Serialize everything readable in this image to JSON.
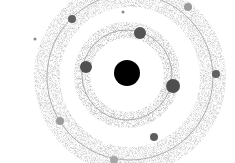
{
  "diagram": {
    "type": "orbital-system",
    "canvas": {
      "width": 235,
      "height": 163,
      "background": "#ffffff"
    },
    "nucleus": {
      "cx": 127,
      "cy": 73,
      "r": 13,
      "color": "#000000"
    },
    "orbits": [
      {
        "id": "inner",
        "cx": 127,
        "cy": 75,
        "r": 45,
        "line_color": "#9a9a9a",
        "halo_color": "#b8b8b8",
        "halo_width": 16
      },
      {
        "id": "outer",
        "cx": 130,
        "cy": 77,
        "r": 83,
        "line_color": "#a0a0a0",
        "halo_color": "#c4c4c4",
        "halo_width": 26
      }
    ],
    "bodies": [
      {
        "orbit": "inner",
        "cx": 140,
        "cy": 33,
        "r": 6,
        "color": "#555555"
      },
      {
        "orbit": "inner",
        "cx": 86,
        "cy": 67,
        "r": 6,
        "color": "#505050"
      },
      {
        "orbit": "inner",
        "cx": 173,
        "cy": 86,
        "r": 7,
        "color": "#4f4f4f"
      },
      {
        "orbit": "outer",
        "cx": 72,
        "cy": 19,
        "r": 4,
        "color": "#606060"
      },
      {
        "orbit": "outer",
        "cx": 188,
        "cy": 7,
        "r": 4,
        "color": "#9a9a9a"
      },
      {
        "orbit": "outer",
        "cx": 216,
        "cy": 74,
        "r": 4,
        "color": "#626262"
      },
      {
        "orbit": "outer",
        "cx": 60,
        "cy": 121,
        "r": 4,
        "color": "#9c9c9c"
      },
      {
        "orbit": "outer",
        "cx": 154,
        "cy": 137,
        "r": 4,
        "color": "#5e5e5e"
      },
      {
        "orbit": "outer",
        "cx": 114,
        "cy": 160,
        "r": 4,
        "color": "#a6a6a6"
      },
      {
        "orbit": "none",
        "cx": 123,
        "cy": 12,
        "r": 1.5,
        "color": "#8a8a8a"
      },
      {
        "orbit": "none",
        "cx": 35,
        "cy": 39,
        "r": 1.5,
        "color": "#8a8a8a"
      }
    ]
  }
}
